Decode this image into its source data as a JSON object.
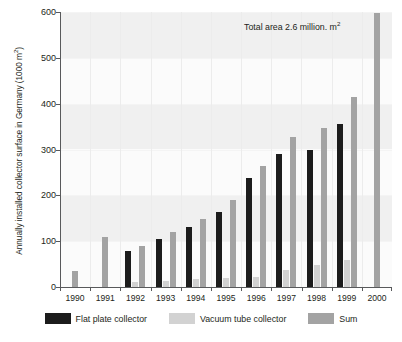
{
  "chart_data": {
    "type": "bar",
    "title": "",
    "xlabel": "",
    "ylabel": "Annually installed collector surface in Germany (1000 m²)",
    "ylabel_main": "Annually installed collector surface in Germany (1000 m",
    "ylabel_sup": "2",
    "ylabel_tail": ")",
    "categories": [
      "1990",
      "1991",
      "1992",
      "1993",
      "1994",
      "1995",
      "1996",
      "1997",
      "1998",
      "1999",
      "2000"
    ],
    "series": [
      {
        "name": "Flat plate collector",
        "color": "#1c1c1c",
        "values": [
          0,
          0,
          78,
          105,
          130,
          163,
          238,
          290,
          300,
          355,
          0
        ]
      },
      {
        "name": "Vacuum tube collector",
        "color": "#d2d2d2",
        "values": [
          0,
          0,
          12,
          14,
          17,
          20,
          22,
          38,
          48,
          60,
          0
        ]
      },
      {
        "name": "Sum",
        "color": "#a3a3a3",
        "values": [
          35,
          110,
          90,
          120,
          148,
          190,
          265,
          328,
          347,
          415,
          597
        ]
      }
    ],
    "ylim": [
      0,
      600
    ],
    "yticks": [
      0,
      100,
      200,
      300,
      400,
      500,
      600
    ],
    "ytick_labels": [
      "0",
      "100",
      "200",
      "300",
      "400",
      "500",
      "600"
    ],
    "grid": "horizontal-bands-and-vertical-separators",
    "legend_position": "bottom-center",
    "annotations": [
      {
        "text": "Total area 2.6 million. m²",
        "text_main": "Total area 2.6 million. m",
        "text_sup": "2"
      }
    ]
  },
  "legend": {
    "items": [
      {
        "label": "Flat plate collector",
        "color": "#1c1c1c"
      },
      {
        "label": "Vacuum tube collector",
        "color": "#d2d2d2"
      },
      {
        "label": "Sum",
        "color": "#a3a3a3"
      }
    ]
  }
}
